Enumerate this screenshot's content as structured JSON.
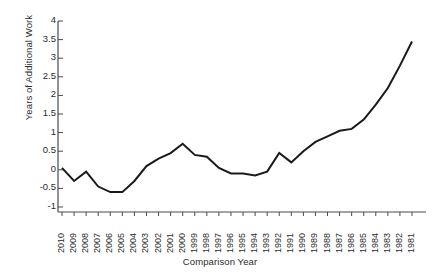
{
  "chart_data": {
    "type": "line",
    "title": "",
    "xlabel": "Comparison Year",
    "ylabel": "Years of Additional Work",
    "grid": false,
    "legend": false,
    "ylim": [
      -1,
      4
    ],
    "yticks": [
      -1,
      -0.5,
      0,
      0.5,
      1,
      1.5,
      2,
      2.5,
      3,
      3.5,
      4
    ],
    "ytick_labels": [
      "-1",
      "-0.5",
      "0",
      "0.5",
      "1",
      "1.5",
      "2",
      "2.5",
      "3",
      "3.5",
      "4"
    ],
    "categories": [
      "2010",
      "2009",
      "2008",
      "2007",
      "2006",
      "2005",
      "2004",
      "2003",
      "2002",
      "2001",
      "2000",
      "1999",
      "1998",
      "1997",
      "1996",
      "1995",
      "1994",
      "1993",
      "1992",
      "1991",
      "1990",
      "1989",
      "1988",
      "1987",
      "1986",
      "1985",
      "1984",
      "1983",
      "1982",
      "1981"
    ],
    "series": [
      {
        "name": "Years of Additional Work",
        "color": "#1a1a1a",
        "values": [
          0.05,
          -0.3,
          -0.05,
          -0.45,
          -0.6,
          -0.6,
          -0.3,
          0.1,
          0.3,
          0.45,
          0.7,
          0.4,
          0.35,
          0.05,
          -0.1,
          -0.1,
          -0.15,
          -0.05,
          0.45,
          0.2,
          0.5,
          0.75,
          0.9,
          1.05,
          1.1,
          1.35,
          1.75,
          2.2,
          2.8,
          3.45
        ]
      }
    ]
  },
  "axes": {
    "y_axis_name": "y-axis",
    "x_axis_name": "x-axis"
  }
}
